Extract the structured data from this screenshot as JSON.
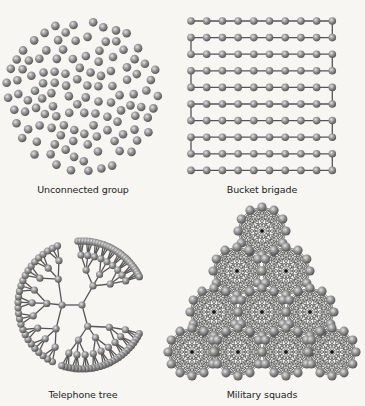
{
  "figure": {
    "background": "#f7f6f3",
    "node_color": "#8c8c8c",
    "node_highlight": "#d8d8d8",
    "node_shadow": "#4a4a4a",
    "edge_color": "#555555",
    "panels": [
      {
        "id": "unconnected",
        "label": "Unconnected group",
        "label_pos": [
          83,
          192
        ]
      },
      {
        "id": "bucket",
        "label": "Bucket brigade",
        "label_pos": [
          262,
          192
        ]
      },
      {
        "id": "tree",
        "label": "Telephone tree",
        "label_pos": [
          83,
          397
        ]
      },
      {
        "id": "squads",
        "label": "Military squads",
        "label_pos": [
          262,
          397
        ]
      }
    ]
  },
  "unconnected": {
    "center": [
      83,
      96
    ],
    "radius": 78,
    "node_count": 120,
    "node_r": 4.3,
    "seed": 7
  },
  "bucket": {
    "origin": [
      191,
      21
    ],
    "cols": 10,
    "rows": 10,
    "dx": 15.7,
    "dy": 16.6,
    "node_r": 3.8
  },
  "tree": {
    "root": [
      82,
      305
    ],
    "branches": [
      {
        "angle": -60,
        "len": 22
      },
      {
        "angle": 180,
        "len": 20
      },
      {
        "angle": 75,
        "len": 22
      }
    ],
    "leaf_radius": 64,
    "node_r": 3.6,
    "gap_start": -20,
    "gap_end": 20
  },
  "squads": {
    "centers": [
      [
        262,
        231
      ],
      [
        237,
        271
      ],
      [
        286,
        271
      ],
      [
        214,
        312
      ],
      [
        262,
        312
      ],
      [
        310,
        312
      ],
      [
        192,
        352
      ],
      [
        238,
        352
      ],
      [
        286,
        352
      ],
      [
        332,
        352
      ]
    ],
    "outer_count": 12,
    "outer_r": 24,
    "inner_rings": [
      18,
      14,
      10,
      6
    ],
    "node_r": 4.6
  }
}
